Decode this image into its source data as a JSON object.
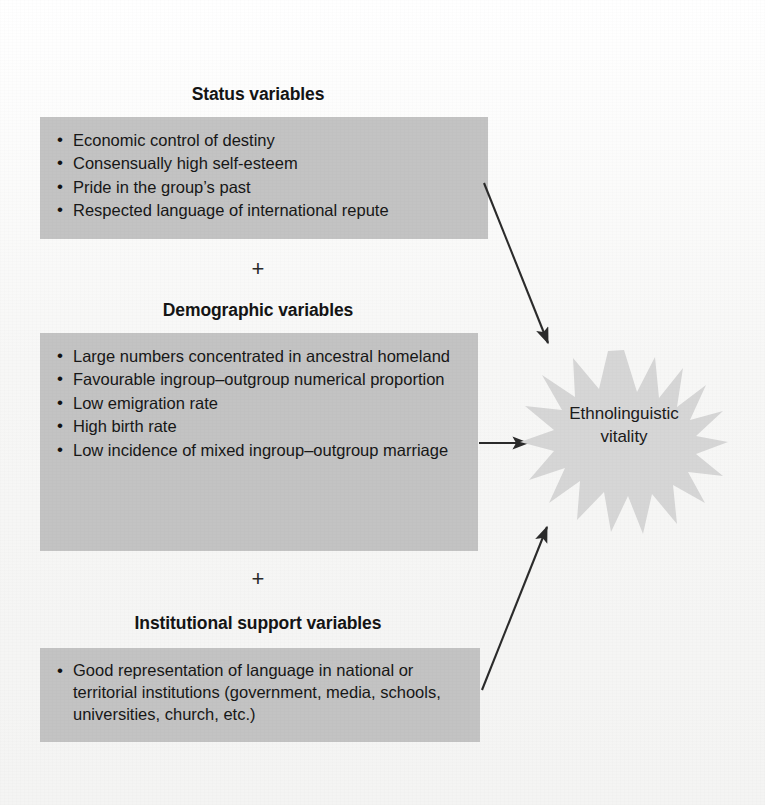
{
  "figure": {
    "title": "Ethnolinguistic vitality",
    "plus_symbol": "+",
    "background_color": "#f7f7f6",
    "box_color": "#c3c3c3",
    "burst_color": "#d6d6d6",
    "arrow_color": "#2b2b2b"
  },
  "groups": [
    {
      "heading": "Status variables",
      "items": [
        "Economic control of destiny",
        "Consensually high self-esteem",
        "Pride in the group’s past",
        "Respected language of international repute"
      ]
    },
    {
      "heading": "Demographic variables",
      "items": [
        "Large numbers concentrated in ancestral homeland",
        "Favourable ingroup–outgroup numerical proportion",
        "Low emigration rate",
        "High birth rate",
        "Low incidence of mixed ingroup–outgroup marriage"
      ]
    },
    {
      "heading": "Institutional support variables",
      "items": [
        "Good representation of language in national or territorial institutions (government, media, schools, universities, church, etc.)"
      ]
    }
  ],
  "outcome": {
    "line1": "Ethnolinguistic",
    "line2": "vitality"
  },
  "connectors": [
    {
      "name": "status-to-vitality",
      "kind": "arrow",
      "direction": "down-right"
    },
    {
      "name": "demographic-to-vitality",
      "kind": "arrow",
      "direction": "right"
    },
    {
      "name": "institutional-to-vitality",
      "kind": "arrow",
      "direction": "up-right"
    }
  ]
}
